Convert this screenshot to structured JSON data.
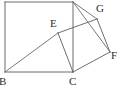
{
  "figure": {
    "type": "geometry-diagram",
    "background_color": "#ffffff",
    "stroke_color": "#5c5c5c",
    "stroke_color_dark": "#3a3a3a",
    "stroke_width": 0.9,
    "label_color": "#2b2b2b",
    "label_font_size": 11,
    "canvas": {
      "width": 128,
      "height": 94
    },
    "points": {
      "A": {
        "x": 73,
        "y": 2,
        "label": "",
        "labeled": false
      },
      "D": {
        "x": 5,
        "y": 2,
        "label": "",
        "labeled": false
      },
      "B": {
        "x": 5,
        "y": 72,
        "label": "B",
        "labeled": true,
        "label_x": -1,
        "label_y": 76
      },
      "C": {
        "x": 73,
        "y": 72,
        "label": "C",
        "labeled": true,
        "label_x": 69,
        "label_y": 76
      },
      "E": {
        "x": 58,
        "y": 33,
        "label": "E",
        "labeled": true,
        "label_x": 50,
        "label_y": 18
      },
      "G": {
        "x": 97,
        "y": 19,
        "label": "G",
        "labeled": true,
        "label_x": 96,
        "label_y": 3
      },
      "F": {
        "x": 110,
        "y": 52,
        "label": "F",
        "labeled": true,
        "label_x": 111,
        "label_y": 50
      }
    },
    "segments": [
      {
        "name": "square-top-edge",
        "from": "D",
        "to": "A",
        "x1": 5,
        "y1": 2,
        "x2": 73,
        "y2": 2,
        "color": "#5c5c5c"
      },
      {
        "name": "square-left-edge",
        "from": "D",
        "to": "B",
        "x1": 5,
        "y1": 2,
        "x2": 5,
        "y2": 72,
        "color": "#5c5c5c"
      },
      {
        "name": "square-bottom-edge",
        "from": "B",
        "to": "C",
        "x1": 5,
        "y1": 72,
        "x2": 73,
        "y2": 72,
        "color": "#5c5c5c"
      },
      {
        "name": "square-right-edge",
        "from": "A",
        "to": "C",
        "x1": 73,
        "y1": 2,
        "x2": 73,
        "y2": 72,
        "color": "#5c5c5c"
      },
      {
        "name": "diagonal-b-to-e",
        "from": "B",
        "to": "E",
        "x1": 5,
        "y1": 72,
        "x2": 58,
        "y2": 33,
        "color": "#6b6b6b"
      },
      {
        "name": "segment-e-to-g",
        "from": "E",
        "to": "G",
        "x1": 58,
        "y1": 33,
        "x2": 97,
        "y2": 19,
        "color": "#5c5c5c"
      },
      {
        "name": "segment-e-to-c",
        "from": "E",
        "to": "C",
        "x1": 58,
        "y1": 33,
        "x2": 73,
        "y2": 72,
        "color": "#5c5c5c"
      },
      {
        "name": "segment-g-to-f",
        "from": "G",
        "to": "F",
        "x1": 97,
        "y1": 19,
        "x2": 110,
        "y2": 52,
        "color": "#5c5c5c"
      },
      {
        "name": "segment-c-to-f",
        "from": "C",
        "to": "F",
        "x1": 73,
        "y1": 72,
        "x2": 110,
        "y2": 52,
        "color": "#5c5c5c"
      },
      {
        "name": "segment-a-to-g",
        "from": "A",
        "to": "G",
        "x1": 73,
        "y1": 2,
        "x2": 97,
        "y2": 19,
        "color": "#6b6b6b"
      },
      {
        "name": "segment-a-to-f",
        "from": "A",
        "to": "F",
        "x1": 73,
        "y1": 2,
        "x2": 110,
        "y2": 52,
        "color": "#6b6b6b"
      }
    ],
    "labels": [
      {
        "name": "vertex-label-b",
        "text": "B",
        "x": -1,
        "y": 76
      },
      {
        "name": "vertex-label-c",
        "text": "C",
        "x": 69,
        "y": 76
      },
      {
        "name": "vertex-label-e",
        "text": "E",
        "x": 50,
        "y": 18
      },
      {
        "name": "vertex-label-g",
        "text": "G",
        "x": 96,
        "y": 3
      },
      {
        "name": "vertex-label-f",
        "text": "F",
        "x": 111,
        "y": 50
      }
    ]
  }
}
